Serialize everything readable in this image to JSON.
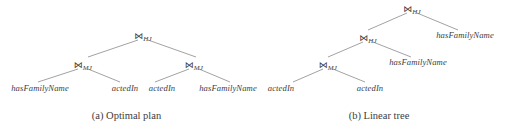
{
  "figures": [
    {
      "id": "optimal-plan",
      "caption": "(a) Optimal plan",
      "nodes": {
        "root": {
          "symbol": "⋈",
          "subscript": "HJ"
        },
        "left_join": {
          "symbol": "⋈",
          "subscript": "MJ"
        },
        "right_join": {
          "symbol": "⋈",
          "subscript": "MJ"
        },
        "leaf_1": {
          "label": "hasFamilyName"
        },
        "leaf_2": {
          "label": "actedIn"
        },
        "leaf_3": {
          "label": "actedIn"
        },
        "leaf_4": {
          "label": "hasFamilyName"
        }
      }
    },
    {
      "id": "linear-tree",
      "caption": "(b) Linear tree",
      "nodes": {
        "root": {
          "symbol": "⋈",
          "subscript": "HJ"
        },
        "mid_join": {
          "symbol": "⋈",
          "subscript": "HJ"
        },
        "low_join": {
          "symbol": "⋈",
          "subscript": "MJ"
        },
        "leaf_1": {
          "label": "actedIn"
        },
        "leaf_2": {
          "label": "actedIn"
        },
        "leaf_3": {
          "label": "hasFamilyName"
        },
        "leaf_4": {
          "label": "hasFamilyName"
        }
      }
    }
  ],
  "colors": {
    "text": "#3d3d3d",
    "edge": "#7a7a7a",
    "background": "#ffffff"
  }
}
